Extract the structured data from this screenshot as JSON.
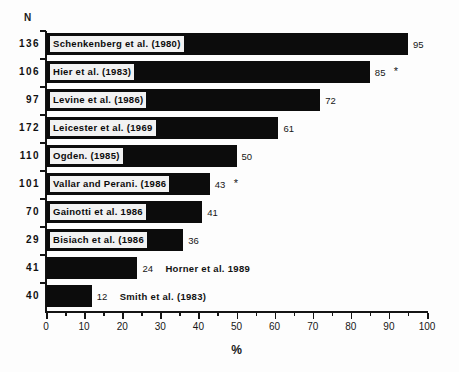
{
  "chart_data": {
    "type": "bar",
    "orientation": "horizontal",
    "title": "",
    "xlabel": "%",
    "ylabel": "",
    "xlim": [
      0,
      100
    ],
    "xticks": [
      0,
      10,
      20,
      30,
      40,
      50,
      60,
      70,
      80,
      90,
      100
    ],
    "minor_tick_step": 5,
    "grid": false,
    "legend": null,
    "n_column_header": "N",
    "footnote_marker": "*",
    "categories": [
      "Schenkenberg et al. (1980)",
      "Hier et al. (1983)",
      "Levine et al. (1986)",
      "Leicester et al. (1969",
      "Ogden. (1985)",
      "Vallar and Perani. (1986",
      "Gainotti et al. 1986",
      "Bisiach et al. (1986",
      "Horner et al. 1989",
      "Smith et al. (1983)"
    ],
    "values": [
      95,
      85,
      72,
      61,
      50,
      43,
      41,
      36,
      24,
      12
    ],
    "n_values": [
      136,
      106,
      97,
      172,
      110,
      101,
      70,
      29,
      41,
      40
    ],
    "bar_color": "#0c0c0c",
    "background_color": "#fdfdfd"
  },
  "rows": [
    {
      "n": "136",
      "label": "Schenkenberg  et  al.  (1980)",
      "value": "95",
      "value_num": 95,
      "inside": true,
      "star": ""
    },
    {
      "n": "106",
      "label": "Hier  et  al.  (1983)",
      "value": "85",
      "value_num": 85,
      "inside": true,
      "star": "*"
    },
    {
      "n": "97",
      "label": "Levine  et  al.  (1986)",
      "value": "72",
      "value_num": 72,
      "inside": true,
      "star": ""
    },
    {
      "n": "172",
      "label": "Leicester  et  al.  (1969",
      "value": "61",
      "value_num": 61,
      "inside": true,
      "star": ""
    },
    {
      "n": "110",
      "label": "Ogden.  (1985)",
      "value": "50",
      "value_num": 50,
      "inside": true,
      "star": ""
    },
    {
      "n": "101",
      "label": "Vallar  and  Perani.  (1986",
      "value": "43",
      "value_num": 43,
      "inside": true,
      "star": "*"
    },
    {
      "n": "70",
      "label": "Gainotti  et  al.  1986",
      "value": "41",
      "value_num": 41,
      "inside": true,
      "star": ""
    },
    {
      "n": "29",
      "label": "Bisiach  et  al.  (1986",
      "value": "36",
      "value_num": 36,
      "inside": true,
      "star": ""
    },
    {
      "n": "41",
      "label": "Horner  et  al.  1989",
      "value": "24",
      "value_num": 24,
      "inside": false,
      "star": ""
    },
    {
      "n": "40",
      "label": "Smith  et  al.  (1983)",
      "value": "12",
      "value_num": 12,
      "inside": false,
      "star": ""
    }
  ],
  "axis": {
    "header": "N",
    "title": "%",
    "ticks": [
      "0",
      "10",
      "20",
      "30",
      "40",
      "50",
      "60",
      "70",
      "80",
      "90",
      "100"
    ]
  }
}
